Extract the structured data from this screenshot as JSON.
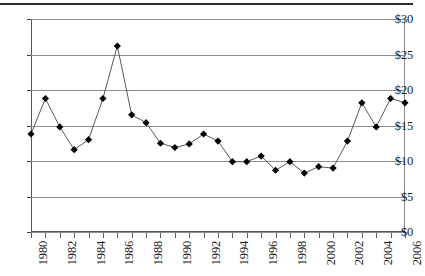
{
  "chart_data": {
    "type": "line",
    "title": "",
    "subtitle": "",
    "xlabel": "",
    "ylabel": "",
    "grid": true,
    "legend": false,
    "marker": "diamond",
    "marker_color": "#000000",
    "line_color": "#5a5a5a",
    "gridline_color": "#8e8e8e",
    "xlim": [
      1980,
      2006
    ],
    "ylim": [
      0,
      30
    ],
    "y_ticks": [
      0,
      5,
      10,
      15,
      20,
      25,
      30
    ],
    "y_tick_labels": [
      "$0",
      "$5",
      "$10",
      "$15",
      "$20",
      "$25",
      "$30"
    ],
    "x_tick_labels": [
      "1980",
      "",
      "1982",
      "",
      "1984",
      "",
      "1986",
      "",
      "1988",
      "",
      "1990",
      "",
      "1992",
      "",
      "1994",
      "",
      "1996",
      "",
      "1998",
      "",
      "2000",
      "",
      "2002",
      "",
      "2004",
      "",
      "2006"
    ],
    "x": [
      1980,
      1981,
      1982,
      1983,
      1984,
      1985,
      1986,
      1987,
      1988,
      1989,
      1990,
      1991,
      1992,
      1993,
      1994,
      1995,
      1996,
      1997,
      1998,
      1999,
      2000,
      2001,
      2002,
      2003,
      2004,
      2005,
      2006
    ],
    "values": [
      13.8,
      18.8,
      14.8,
      11.6,
      13.0,
      18.8,
      26.2,
      16.5,
      15.4,
      12.5,
      11.9,
      12.4,
      13.8,
      12.8,
      9.9,
      9.9,
      10.7,
      8.7,
      9.9,
      8.3,
      9.2,
      9.0,
      12.8,
      18.2,
      14.8,
      18.8,
      18.2
    ]
  }
}
